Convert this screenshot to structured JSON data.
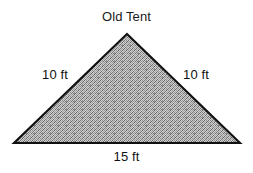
{
  "figure": {
    "title": "Old Tent",
    "shape_name": "triangle",
    "background_color": "#ffffff",
    "outline_color": "#111111",
    "fill_description": "gray-dither-halftone",
    "fill_color": "#9a9a9a",
    "text_color": "#111111"
  },
  "labels": {
    "left_side": "10 ft",
    "right_side": "10 ft",
    "base": "15 ft"
  },
  "geometry": {
    "apex": {
      "x": 127,
      "y": 34
    },
    "bottom_left": {
      "x": 14,
      "y": 143
    },
    "bottom_right": {
      "x": 240,
      "y": 143
    }
  }
}
